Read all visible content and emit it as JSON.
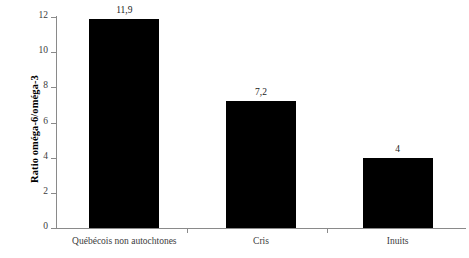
{
  "chart_data": {
    "type": "bar",
    "title": "",
    "subtitle": "",
    "xlabel": "",
    "ylabel": "Ratio oméga-6/oméga-3",
    "categories": [
      "Québécois non autochtones",
      "Cris",
      "Inuits"
    ],
    "values": [
      11.9,
      7.2,
      4
    ],
    "value_labels": [
      "11,9",
      "7,2",
      "4"
    ],
    "ylim": [
      0,
      12
    ],
    "yticks": [
      0,
      2,
      4,
      6,
      8,
      10,
      12
    ],
    "ytick_labels": [
      "0",
      "2",
      "4",
      "6",
      "8",
      "10",
      "12"
    ],
    "grid": false,
    "legend": null,
    "bar_color": "#000000",
    "axis_color": "#8a8a8a",
    "background_color": "#ffffff",
    "decimal_separator": ","
  }
}
